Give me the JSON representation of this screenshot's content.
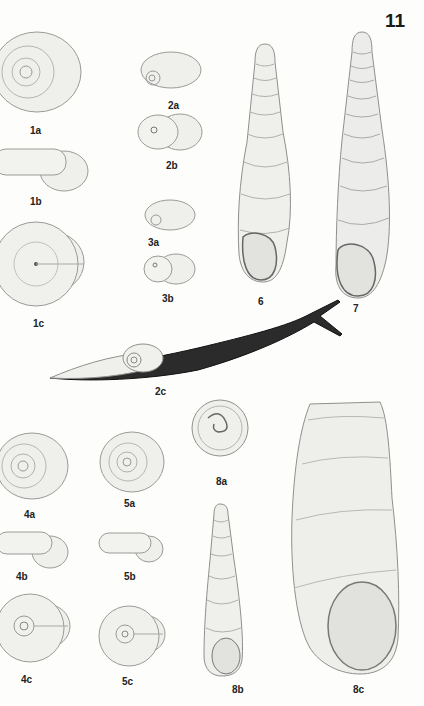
{
  "plate": {
    "number": "11"
  },
  "figures": [
    {
      "id": "1a",
      "label": "1a",
      "kind": "snail shell, apical view"
    },
    {
      "id": "1b",
      "label": "1b",
      "kind": "snail shell, side view"
    },
    {
      "id": "1c",
      "label": "1c",
      "kind": "snail shell, umbilical view"
    },
    {
      "id": "2a",
      "label": "2a",
      "kind": "small shell, apical view"
    },
    {
      "id": "2b",
      "label": "2b",
      "kind": "small shell, apertural view"
    },
    {
      "id": "2c",
      "label": "2c",
      "kind": "semi-slug with shell"
    },
    {
      "id": "3a",
      "label": "3a",
      "kind": "small shell, apical view"
    },
    {
      "id": "3b",
      "label": "3b",
      "kind": "small shell, apertural view"
    },
    {
      "id": "4a",
      "label": "4a",
      "kind": "snail shell, apical view"
    },
    {
      "id": "4b",
      "label": "4b",
      "kind": "snail shell, side view"
    },
    {
      "id": "4c",
      "label": "4c",
      "kind": "snail shell, umbilical view"
    },
    {
      "id": "5a",
      "label": "5a",
      "kind": "snail shell, apical view"
    },
    {
      "id": "5b",
      "label": "5b",
      "kind": "snail shell, side view"
    },
    {
      "id": "5c",
      "label": "5c",
      "kind": "snail shell, umbilical view"
    },
    {
      "id": "6",
      "label": "6",
      "kind": "elongate door snail shell"
    },
    {
      "id": "7",
      "label": "7",
      "kind": "elongate ribbed door snail shell"
    },
    {
      "id": "8a",
      "label": "8a",
      "kind": "shell, apical view"
    },
    {
      "id": "8b",
      "label": "8b",
      "kind": "juvenile conical shell"
    },
    {
      "id": "8c",
      "label": "8c",
      "kind": "truncated adult shell"
    }
  ],
  "colors": {
    "background": "#fdfdfc",
    "shell_fill": "#efefec",
    "stroke": "#9a9a96",
    "slug_body": "#2b2b2b"
  }
}
